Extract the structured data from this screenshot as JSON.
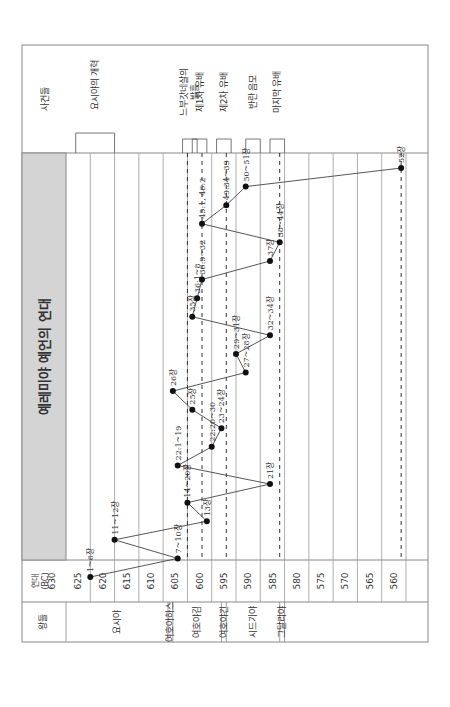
{
  "title": "예레미야 예언의 연대",
  "headers": {
    "year_axis": "연대 (BC)",
    "kings": "왕들",
    "events": "사건들"
  },
  "colors": {
    "title_band": "#d4d4d4",
    "grid": "#999999",
    "line": "#444444",
    "point": "#111111",
    "border": "#888888"
  },
  "chart_data": {
    "type": "line",
    "title": "예레미야 예언의 연대",
    "xlabel": "연대 (BC)",
    "ylabel": "",
    "orientation": "rotated 90° counter-clockwise (time axis runs bottom→top in image)",
    "year_ticks": [
      630,
      625,
      620,
      615,
      610,
      605,
      600,
      595,
      590,
      585,
      580,
      575,
      570,
      565,
      560
    ],
    "ylim": [
      630,
      560
    ],
    "grid": true,
    "points": [
      {
        "label": "1~6장",
        "year": 625,
        "order": 1
      },
      {
        "label": "7~10장",
        "year": 607,
        "order": 2
      },
      {
        "label": "11~12장",
        "year": 620,
        "order": 3
      },
      {
        "label": "13장",
        "year": 601,
        "order": 4
      },
      {
        "label": "14~20장",
        "year": 605,
        "order": 5
      },
      {
        "label": "21장",
        "year": 588,
        "order": 6
      },
      {
        "label": "22:1~19",
        "year": 607,
        "order": 7
      },
      {
        "label": "22:20~30",
        "year": 600,
        "order": 8
      },
      {
        "label": "23~24장",
        "year": 598,
        "order": 9
      },
      {
        "label": "25장",
        "year": 604,
        "order": 10
      },
      {
        "label": "26장",
        "year": 608,
        "order": 11
      },
      {
        "label": "27~28장",
        "year": 593,
        "order": 12
      },
      {
        "label": "29~31장",
        "year": 595,
        "order": 13
      },
      {
        "label": "32~34장",
        "year": 588,
        "order": 14
      },
      {
        "label": "35장",
        "year": 604,
        "order": 15
      },
      {
        "label": "36:1~8",
        "year": 603,
        "order": 16
      },
      {
        "label": "36:9~32",
        "year": 602,
        "order": 17
      },
      {
        "label": "37장",
        "year": 588,
        "order": 18
      },
      {
        "label": "38~44장",
        "year": 586,
        "order": 19
      },
      {
        "label": "45:1, 46:2",
        "year": 602,
        "order": 20
      },
      {
        "label": "49:34~39",
        "year": 597,
        "order": 21
      },
      {
        "label": "50~51장",
        "year": 593,
        "order": 22
      },
      {
        "label": "52장",
        "year": 561,
        "order": 23
      }
    ],
    "dashed_lines": [
      605,
      602,
      597,
      586,
      561
    ],
    "kings": [
      {
        "name": "요시야",
        "from": 630,
        "to": 609
      },
      {
        "name": "여호아하스",
        "from": 609,
        "to": 608
      },
      {
        "name": "여호야김",
        "from": 608,
        "to": 598
      },
      {
        "name": "여호야긴",
        "from": 598,
        "to": 597
      },
      {
        "name": "시드기야",
        "from": 597,
        "to": 586
      },
      {
        "name": "그달리야",
        "from": 586,
        "to": 585
      }
    ],
    "events": [
      {
        "label": "요시야의 개혁",
        "from": 628,
        "to": 620
      },
      {
        "label": "느부갓네살의 발흥",
        "from": 606,
        "to": 603
      },
      {
        "label": "제1차 유배",
        "from": 604,
        "to": 601
      },
      {
        "label": "제2차 유배",
        "from": 599,
        "to": 596
      },
      {
        "label": "반란 음모",
        "from": 593,
        "to": 590
      },
      {
        "label": "마지막 유배",
        "from": 588,
        "to": 585
      }
    ]
  }
}
